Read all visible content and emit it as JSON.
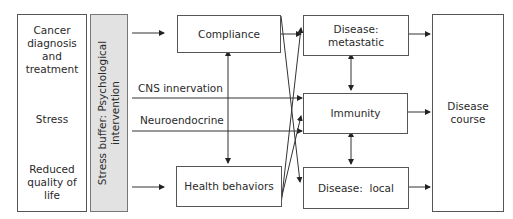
{
  "diagram": {
    "left_column": {
      "top": "Cancer diagnosis and treatment",
      "top_lines": [
        "Cancer",
        "diagnosis and",
        "treatment"
      ],
      "middle": "Stress",
      "bottom_lines": [
        "Reduced",
        "quality of",
        "life"
      ]
    },
    "buffer": {
      "lines": [
        "Stress buffer: Psychological",
        "intervention"
      ]
    },
    "pathways": {
      "compliance": "Compliance",
      "cns": "CNS innervation",
      "neuroendocrine": "Neuroendocrine",
      "health_behaviors": "Health behaviors"
    },
    "outcomes": {
      "metastatic_lines": [
        "Disease:",
        "metastatic"
      ],
      "immunity": "Immunity",
      "local": "Disease:  local"
    },
    "result": {
      "lines": [
        "Disease",
        "course"
      ]
    },
    "colors": {
      "line": "#333333",
      "box_border": "#555555",
      "buffer_fill": "#e2e2e2"
    }
  }
}
